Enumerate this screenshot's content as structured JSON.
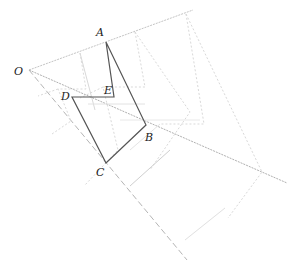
{
  "diagram": {
    "title": "",
    "points": {
      "O": {
        "label": "O",
        "x": 29,
        "y": 70,
        "lx": 14,
        "ly": 75
      },
      "A": {
        "label": "A",
        "x": 106,
        "y": 42,
        "lx": 96,
        "ly": 36
      },
      "E": {
        "label": "E",
        "x": 114,
        "y": 97,
        "lx": 104,
        "ly": 94
      },
      "D": {
        "label": "D",
        "x": 72,
        "y": 97,
        "lx": 61,
        "ly": 100
      },
      "B": {
        "label": "B",
        "x": 146,
        "y": 125,
        "lx": 145,
        "ly": 141
      },
      "C": {
        "label": "C",
        "x": 106,
        "y": 163,
        "lx": 96,
        "ly": 176
      }
    },
    "polygon_ABCDE": "106,42 146,125 106,163 72,97 114,97 106,42",
    "ray_OA_end": {
      "x": 193,
      "y": 10
    },
    "ray_OB_end": {
      "x": 287,
      "y": 183
    },
    "ray_OC_end": {
      "x": 187,
      "y": 260
    },
    "colors": {
      "main": "#555555",
      "ray": "#b8b8b8",
      "ghost": "#d6d6d6",
      "label": "#222222"
    }
  }
}
